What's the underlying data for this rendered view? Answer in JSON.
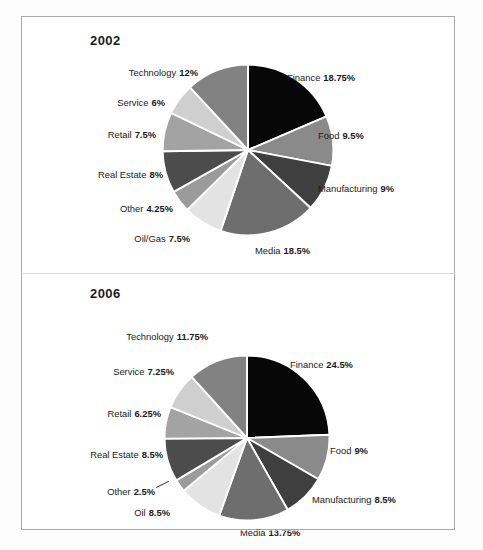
{
  "page": {
    "border_color": "#a9a9ab",
    "background": "#ffffff"
  },
  "panels": [
    {
      "id": "panel-2002",
      "title": "2002",
      "chart_index": 0
    },
    {
      "id": "panel-2006",
      "title": "2006",
      "chart_index": 1
    }
  ],
  "chart_data": [
    {
      "type": "pie",
      "title": "2002",
      "start_angle_deg": 0,
      "direction": "clockwise",
      "total": 100,
      "unit": "%",
      "categories": [
        "Finance",
        "Food",
        "Manufacturing",
        "Media",
        "Oil/Gas",
        "Other",
        "Real Estate",
        "Retail",
        "Service",
        "Technology"
      ],
      "values": [
        18.75,
        9.5,
        9,
        18.5,
        7.5,
        4.25,
        8,
        7.5,
        6,
        12
      ],
      "labels": [
        "Finance  18.75%",
        "Food  9.5%",
        "Manufacturing  9%",
        "Media  18.5%",
        "Oil/Gas  7.5%",
        "Other  4.25%",
        "Real Estate  8%",
        "Retail  7.5%",
        "Service  6%",
        "Technology  12%"
      ],
      "slice_colors": [
        "#070707",
        "#8a8a8a",
        "#3f3f3f",
        "#6e6e6e",
        "#e3e3e3",
        "#9b9b9b",
        "#4c4c4c",
        "#a3a3a3",
        "#cfcfcf",
        "#828282"
      ],
      "slice_separator_color": "#ffffff",
      "legend": "none",
      "grid": false
    },
    {
      "type": "pie",
      "title": "2006",
      "start_angle_deg": 0,
      "direction": "clockwise",
      "total": 100,
      "unit": "%",
      "categories": [
        "Finance",
        "Food",
        "Manufacturing",
        "Media",
        "Oil",
        "Other",
        "Real Estate",
        "Retail",
        "Service",
        "Technology"
      ],
      "values": [
        24.5,
        9,
        8.5,
        13.75,
        8.5,
        2.5,
        8.5,
        6.25,
        7.25,
        11.75
      ],
      "labels": [
        "Finance  24.5%",
        "Food  9%",
        "Manufacturing  8.5%",
        "Media  13.75%",
        "Oil  8.5%",
        "Other  2.5%",
        "Real Estate  8.5%",
        "Retail  6.25%",
        "Service  7.25%",
        "Technology  11.75%"
      ],
      "slice_colors": [
        "#070707",
        "#8a8a8a",
        "#3f3f3f",
        "#6e6e6e",
        "#e3e3e3",
        "#9b9b9b",
        "#4c4c4c",
        "#a3a3a3",
        "#cfcfcf",
        "#828282"
      ],
      "slice_separator_color": "#ffffff",
      "legend": "none",
      "grid": false
    }
  ],
  "labels_2002": {
    "finance": {
      "name": "Finance",
      "pct": "18.75%"
    },
    "food": {
      "name": "Food",
      "pct": "9.5%"
    },
    "manufacturing": {
      "name": "Manufacturing",
      "pct": "9%"
    },
    "media": {
      "name": "Media",
      "pct": "18.5%"
    },
    "oil_gas": {
      "name": "Oil/Gas",
      "pct": "7.5%"
    },
    "other": {
      "name": "Other",
      "pct": "4.25%"
    },
    "real_estate": {
      "name": "Real Estate",
      "pct": "8%"
    },
    "retail": {
      "name": "Retail",
      "pct": "7.5%"
    },
    "service": {
      "name": "Service",
      "pct": "6%"
    },
    "technology": {
      "name": "Technology",
      "pct": "12%"
    }
  },
  "labels_2006": {
    "finance": {
      "name": "Finance",
      "pct": "24.5%"
    },
    "food": {
      "name": "Food",
      "pct": "9%"
    },
    "manufacturing": {
      "name": "Manufacturing",
      "pct": "8.5%"
    },
    "media": {
      "name": "Media",
      "pct": "13.75%"
    },
    "oil": {
      "name": "Oil",
      "pct": "8.5%"
    },
    "other": {
      "name": "Other",
      "pct": "2.5%"
    },
    "real_estate": {
      "name": "Real Estate",
      "pct": "8.5%"
    },
    "retail": {
      "name": "Retail",
      "pct": "6.25%"
    },
    "service": {
      "name": "Service",
      "pct": "7.25%"
    },
    "technology": {
      "name": "Technology",
      "pct": "11.75%"
    }
  }
}
